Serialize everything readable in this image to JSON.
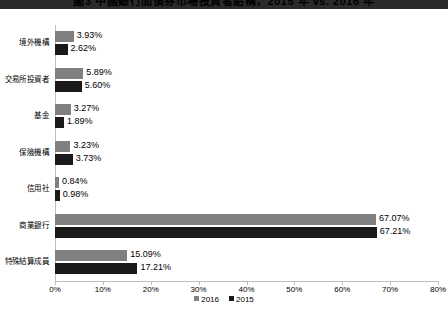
{
  "title": "圖3  中國銀行間債券市場投資者結構，2015 年 vs. 2016 年",
  "chart_data": {
    "type": "bar",
    "orientation": "horizontal",
    "title": "圖3  中國銀行間債券市場投資者結構，2015 年 vs. 2016 年",
    "xlabel": "",
    "ylabel": "",
    "xlim": [
      0,
      80
    ],
    "xticks": [
      0,
      10,
      20,
      30,
      40,
      50,
      60,
      70,
      80
    ],
    "xtick_labels": [
      "0%",
      "10%",
      "20%",
      "30%",
      "40%",
      "50%",
      "60%",
      "70%",
      "80%"
    ],
    "grid": false,
    "legend_position": "bottom",
    "categories": [
      "境外機構",
      "交易所投資者",
      "基金",
      "保險機構",
      "信用社",
      "商業銀行",
      "特殊結算成員"
    ],
    "series": [
      {
        "name": "2016",
        "color": "#808080",
        "values": [
          3.93,
          5.89,
          3.27,
          3.23,
          0.84,
          67.07,
          15.09
        ],
        "labels": [
          "3.93%",
          "5.89%",
          "3.27%",
          "3.23%",
          "0.84%",
          "67.07%",
          "15.09%"
        ]
      },
      {
        "name": "2015",
        "color": "#1a1a1a",
        "values": [
          2.62,
          5.6,
          1.89,
          3.73,
          0.98,
          67.21,
          17.21
        ],
        "labels": [
          "2.62%",
          "5.60%",
          "1.89%",
          "3.73%",
          "0.98%",
          "67.21%",
          "17.21%"
        ]
      }
    ]
  },
  "legend": {
    "items": [
      {
        "label": "2016",
        "color": "#808080"
      },
      {
        "label": "2015",
        "color": "#1a1a1a"
      }
    ]
  }
}
